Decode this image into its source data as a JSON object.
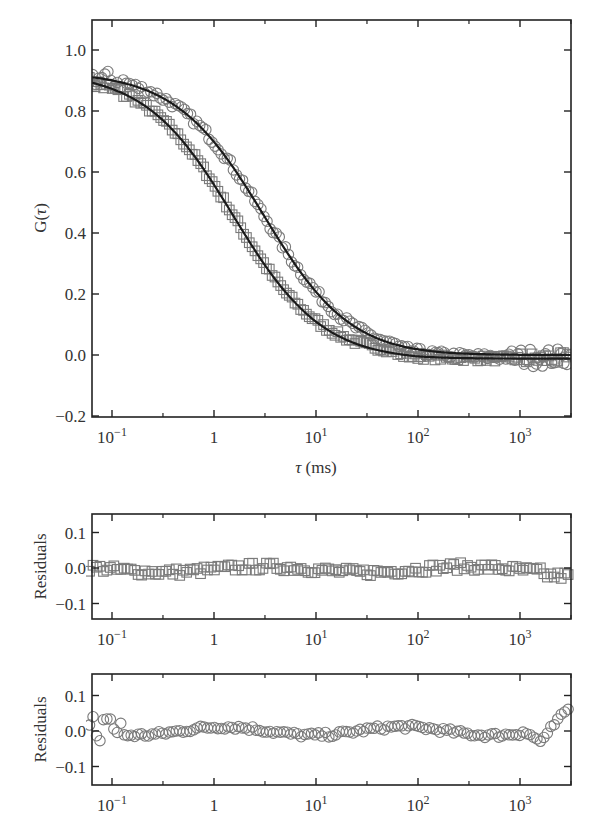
{
  "chart_data": [
    {
      "type": "scatter",
      "title": "",
      "xlabel": "τ (ms)",
      "ylabel": "G(τ)",
      "xscale": "log",
      "xlim": [
        0.063,
        3100
      ],
      "ylim": [
        -0.2,
        1.1
      ],
      "x_ticks": [
        "10−1",
        "1",
        "101",
        "102",
        "103"
      ],
      "y_ticks": [
        "−0.2",
        "0.0",
        "0.2",
        "0.4",
        "0.6",
        "0.8",
        "1.0"
      ],
      "grid": false,
      "legend": null,
      "series": [
        {
          "name": "squares (data)",
          "marker": "square",
          "fit_tau_half_ms": 1.3,
          "x": [
            0.07,
            0.1,
            0.3,
            1,
            3,
            10,
            30,
            100,
            1000,
            3000
          ],
          "values": [
            0.9,
            0.88,
            0.78,
            0.56,
            0.3,
            0.12,
            0.04,
            0.0,
            -0.01,
            -0.01
          ]
        },
        {
          "name": "circles (data)",
          "marker": "circle",
          "fit_tau_half_ms": 2.5,
          "x": [
            0.07,
            0.1,
            0.3,
            1,
            3,
            10,
            30,
            100,
            1000,
            3000
          ],
          "values": [
            0.9,
            0.92,
            0.83,
            0.68,
            0.45,
            0.2,
            0.06,
            0.02,
            -0.01,
            0.05
          ]
        },
        {
          "name": "fit (squares)",
          "marker": "line"
        },
        {
          "name": "fit (circles)",
          "marker": "line"
        }
      ]
    },
    {
      "type": "scatter",
      "ylabel": "Residuals",
      "xscale": "log",
      "xlim": [
        0.063,
        3100
      ],
      "ylim": [
        -0.15,
        0.15
      ],
      "x_ticks": [
        "10−1",
        "1",
        "101",
        "102",
        "103"
      ],
      "y_ticks": [
        "−0.1",
        "0.0",
        "0.1"
      ],
      "series": [
        {
          "name": "squares residuals",
          "marker": "square",
          "range": [
            -0.03,
            0.02
          ]
        }
      ]
    },
    {
      "type": "scatter",
      "ylabel": "Residuals",
      "xscale": "log",
      "xlim": [
        0.063,
        3100
      ],
      "ylim": [
        -0.15,
        0.15
      ],
      "x_ticks": [
        "10−1",
        "1",
        "101",
        "102",
        "103"
      ],
      "y_ticks": [
        "−0.1",
        "0.0",
        "0.1"
      ],
      "series": [
        {
          "name": "circles residuals",
          "marker": "circle",
          "range": [
            -0.05,
            0.06
          ]
        }
      ]
    }
  ],
  "labels": {
    "main_ylabel": "G(",
    "main_ylabel_tau": "τ",
    "main_ylabel_close": ")",
    "xlabel_tau": "τ",
    "xlabel_unit": " (ms)",
    "resid_ylabel": "Residuals",
    "xticks": [
      {
        "base": "10",
        "exp": "−1"
      },
      {
        "base": "1",
        "exp": ""
      },
      {
        "base": "10",
        "exp": "1"
      },
      {
        "base": "10",
        "exp": "2"
      },
      {
        "base": "10",
        "exp": "3"
      }
    ],
    "main_yticks": [
      "1.0",
      "0.8",
      "0.6",
      "0.4",
      "0.2",
      "0.0",
      "−0.2"
    ],
    "resid_yticks": [
      "0.1",
      "0.0",
      "−0.1"
    ]
  },
  "colors": {
    "axis": "#222222",
    "fit": "#1a1a1a",
    "marker": "#7a7a7a"
  }
}
